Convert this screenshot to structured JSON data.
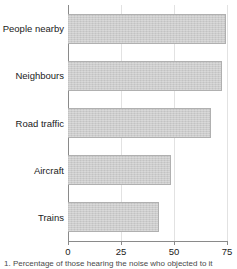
{
  "chart_data": {
    "type": "bar",
    "orientation": "horizontal",
    "title": "",
    "subtitle": "",
    "xlabel": "",
    "ylabel": "",
    "categories": [
      "People nearby",
      "Neighbours",
      "Road traffic",
      "Aircraft",
      "Trains"
    ],
    "values": [
      74.5,
      72.5,
      67.5,
      48.5,
      43
    ],
    "xlim": [
      0,
      75
    ],
    "xticks": [
      0,
      25,
      50,
      75
    ],
    "xtick_labels": [
      "0",
      "25",
      "50",
      "75"
    ],
    "grid": "vertical-faint",
    "legend": "none",
    "bar_color": "#c9c9c9",
    "bar_edge_color": "#b0b0b0",
    "axis_color": "#8a8a8a",
    "gridline_color": "#e2e2e2"
  },
  "caption": {
    "text": "1. Percentage of those hearing the noise who objected to it"
  }
}
